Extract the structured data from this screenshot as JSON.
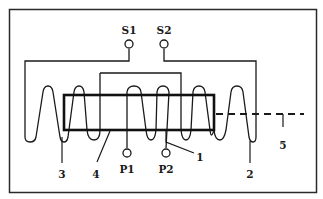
{
  "diagram": {
    "type": "coil-transformer-schematic",
    "colors": {
      "line": "#1a1a1a",
      "background": "#ffffff",
      "frame": "#2a2a2a"
    },
    "terminals": {
      "secondary": [
        {
          "id": "S1",
          "label": "S1"
        },
        {
          "id": "S2",
          "label": "S2"
        }
      ],
      "primary": [
        {
          "id": "P1",
          "label": "P1"
        },
        {
          "id": "P2",
          "label": "P2"
        }
      ]
    },
    "callouts": [
      {
        "id": "1",
        "label": "1"
      },
      {
        "id": "2",
        "label": "2"
      },
      {
        "id": "3",
        "label": "3"
      },
      {
        "id": "4",
        "label": "4"
      },
      {
        "id": "5",
        "label": "5"
      }
    ]
  }
}
